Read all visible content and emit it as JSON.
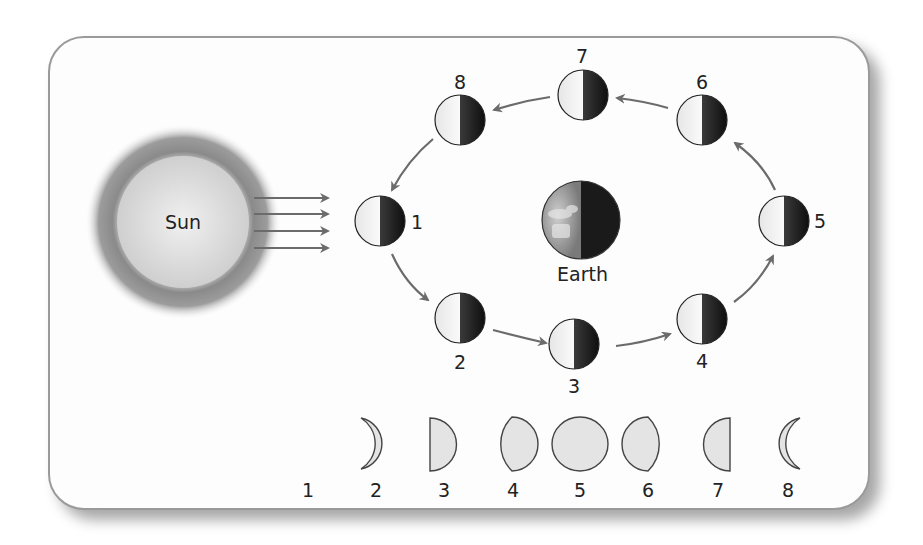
{
  "diagram": {
    "sun": {
      "label": "Sun",
      "rays": 4
    },
    "earth": {
      "label": "Earth"
    },
    "orbit_positions": [
      {
        "id": 1,
        "label": "1"
      },
      {
        "id": 2,
        "label": "2"
      },
      {
        "id": 3,
        "label": "3"
      },
      {
        "id": 4,
        "label": "4"
      },
      {
        "id": 5,
        "label": "5"
      },
      {
        "id": 6,
        "label": "6"
      },
      {
        "id": 7,
        "label": "7"
      },
      {
        "id": 8,
        "label": "8"
      }
    ],
    "phase_row": [
      {
        "id": 1,
        "label": "1",
        "phase": "new-moon"
      },
      {
        "id": 2,
        "label": "2",
        "phase": "waxing-crescent"
      },
      {
        "id": 3,
        "label": "3",
        "phase": "first-quarter"
      },
      {
        "id": 4,
        "label": "4",
        "phase": "waxing-gibbous"
      },
      {
        "id": 5,
        "label": "5",
        "phase": "full-moon"
      },
      {
        "id": 6,
        "label": "6",
        "phase": "waning-gibbous"
      },
      {
        "id": 7,
        "label": "7",
        "phase": "third-quarter"
      },
      {
        "id": 8,
        "label": "8",
        "phase": "waning-crescent"
      }
    ],
    "colors": {
      "card_border": "#9a9a9a",
      "arrow": "#6b6b6b",
      "moon_light": "#f2f2f2",
      "moon_dark": "#1e1e1e",
      "phase_fill": "#e4e4e4"
    }
  }
}
